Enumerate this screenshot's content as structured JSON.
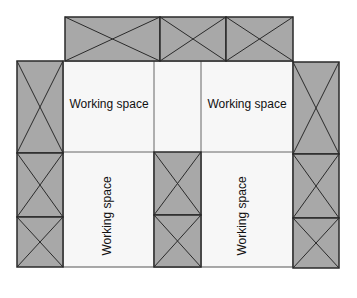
{
  "diagram": {
    "title": "",
    "colors": {
      "rack_fill": "#a8a8a8",
      "rack_stroke": "#2a2a2a",
      "workspace_fill": "#f7f7f7",
      "workspace_stroke": "#555555"
    },
    "working_spaces": [
      {
        "label": "Working space",
        "orientation": "horizontal",
        "position": "top-left"
      },
      {
        "label": "Working space",
        "orientation": "horizontal",
        "position": "top-right"
      },
      {
        "label": "Working space",
        "orientation": "vertical",
        "position": "bottom-left"
      },
      {
        "label": "Working space",
        "orientation": "vertical",
        "position": "bottom-right"
      }
    ],
    "rack_groups": [
      {
        "name": "top-row",
        "units": 3
      },
      {
        "name": "left-column",
        "units": 3
      },
      {
        "name": "center-column",
        "units": 2
      },
      {
        "name": "right-column",
        "units": 3
      }
    ]
  }
}
